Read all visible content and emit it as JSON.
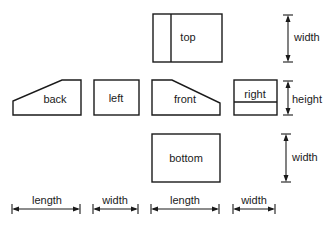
{
  "diagram": {
    "views": {
      "top": "top",
      "back": "back",
      "left": "left",
      "front": "front",
      "right": "right",
      "bottom": "bottom"
    },
    "dimensions": {
      "top_side": "width",
      "middle_side": "height",
      "bottom_side": "width",
      "bottom_row": [
        "length",
        "width",
        "length",
        "width"
      ]
    },
    "colors": {
      "line": "#1a1a1a",
      "background": "#ffffff"
    }
  }
}
